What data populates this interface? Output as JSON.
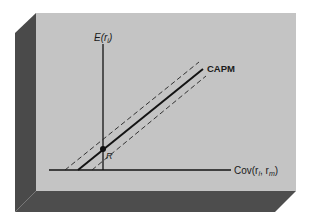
{
  "diagram": {
    "y_axis_label": "E(r_i)",
    "y_axis_label_main": "E(r",
    "y_axis_label_sub": "i",
    "y_axis_label_close": ")",
    "x_axis_label_main": "Cov(r",
    "x_axis_label_sub1": "i",
    "x_axis_label_mid": ", r",
    "x_axis_label_sub2": "m",
    "x_axis_label_close": ")",
    "line_label": "CAPM",
    "point_label": "R",
    "colors": {
      "panel": "#c4c4c4",
      "shadow": "#4a4a4a",
      "ink": "#141414",
      "background": "#ffffff"
    }
  }
}
